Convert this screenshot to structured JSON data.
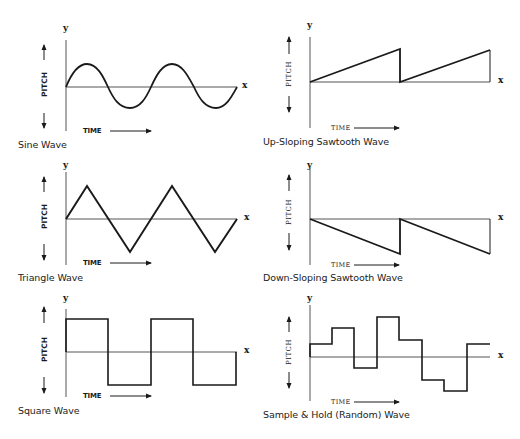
{
  "axis_labels": {
    "y": "y",
    "x": "x",
    "time": "TIME",
    "pitch": "PITCH"
  },
  "panels": [
    {
      "id": "sine",
      "caption": "Sine Wave",
      "type": "sine",
      "cycles": 2
    },
    {
      "id": "up-sawtooth",
      "caption": "Up-Sloping Sawtooth Wave",
      "type": "sawtooth-up",
      "cycles": 2
    },
    {
      "id": "triangle",
      "caption": "Triangle Wave",
      "type": "triangle",
      "cycles": 2
    },
    {
      "id": "down-sawtooth",
      "caption": "Down-Sloping Sawtooth Wave",
      "type": "sawtooth-down",
      "cycles": 2
    },
    {
      "id": "square",
      "caption": "Square Wave",
      "type": "square",
      "cycles": 2
    },
    {
      "id": "sample-hold",
      "caption": "Sample & Hold (Random) Wave",
      "type": "sample-and-hold",
      "steps": [
        0.5,
        1.2,
        -0.5,
        1.7,
        0.7,
        -1.5,
        -1.7,
        0.5
      ]
    }
  ],
  "colors": {
    "line": "#1a1a1a",
    "axis": "#444444",
    "background": "#ffffff"
  }
}
